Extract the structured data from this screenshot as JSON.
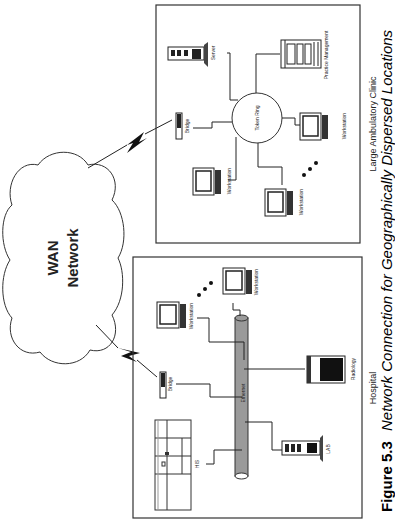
{
  "caption": {
    "figure_label": "Figure 5.3",
    "title": "Network Connection for Geographically Dispersed Locations"
  },
  "cloud": {
    "line1": "WAN",
    "line2": "Network"
  },
  "clinic": {
    "title": "Large Ambulatory Clinic",
    "ring_label": "Token Ring",
    "nodes": {
      "server": "Server",
      "practice": "Practice Management",
      "bridge": "Bridge",
      "ws1": "Workstation",
      "ws2": "Workstation",
      "ws3": "Workstation"
    },
    "ellipsis": "..."
  },
  "hospital": {
    "title": "Hospital",
    "backbone_label": "Ethernet",
    "nodes": {
      "bridge": "Bridge",
      "his": "HIS",
      "lab": "LAB",
      "radiology": "Radiology",
      "ws1": "Workstation",
      "ws2": "Workstation"
    },
    "ellipsis": "..."
  }
}
